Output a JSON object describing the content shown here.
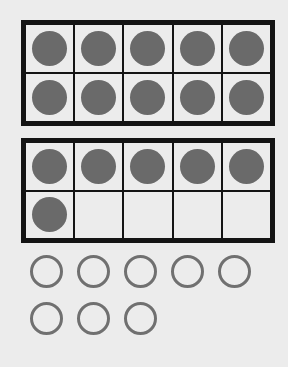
{
  "ten_frames": [
    {
      "cells": [
        1,
        1,
        1,
        1,
        1,
        1,
        1,
        1,
        1,
        1
      ],
      "filled": 10
    },
    {
      "cells": [
        1,
        1,
        1,
        1,
        1,
        1,
        0,
        0,
        0,
        0
      ],
      "filled": 6
    }
  ],
  "loose_counters": {
    "rows": [
      5,
      3
    ],
    "total": 8
  },
  "colors": {
    "border": "#141414",
    "dot": "#6a6a6a",
    "ring": "#707070",
    "background": "#ececec"
  }
}
